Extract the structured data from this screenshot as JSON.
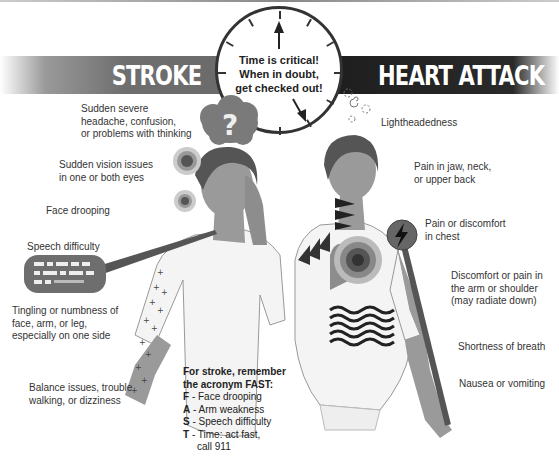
{
  "header": {
    "stroke_title": "STROKE",
    "heart_title": "HEART ATTACK"
  },
  "clock": {
    "line1": "Time is critical!",
    "line2": "When in  doubt,",
    "line3": "get checked out!"
  },
  "stroke": {
    "symptoms": [
      {
        "text_lines": [
          "Sudden severe",
          "headache, confusion,",
          "or problems with thinking"
        ]
      },
      {
        "text_lines": [
          "Sudden vision issues",
          "in one or both eyes"
        ]
      },
      {
        "text_lines": [
          "Face drooping"
        ]
      },
      {
        "text_lines": [
          "Speech difficulty"
        ]
      },
      {
        "text_lines": [
          "Tingling or numbness of",
          "face, arm, or leg,",
          "especially on one side"
        ]
      },
      {
        "text_lines": [
          "Balance issues, trouble",
          "walking, or dizziness"
        ]
      }
    ],
    "icons": {
      "thought_cloud": "question-mark",
      "speech_bubble": "garbled-text"
    },
    "fast": {
      "header_line1": "For stroke, remember",
      "header_line2": "the acronym FAST:",
      "items": [
        {
          "letter": "F",
          "text": " - Face drooping"
        },
        {
          "letter": "A",
          "text": " - Arm weakness"
        },
        {
          "letter": "S",
          "text": " - Speech difficulty"
        },
        {
          "letter": "T",
          "text": " - Time: act fast,",
          "continuation": "call 911"
        }
      ]
    }
  },
  "heart_attack": {
    "symptoms": [
      {
        "text_lines": [
          "Lightheadedness"
        ]
      },
      {
        "text_lines": [
          "Pain in jaw, neck,",
          "or upper back"
        ]
      },
      {
        "text_lines": [
          "Pain or discomfort",
          "in chest"
        ]
      },
      {
        "text_lines": [
          "Discomfort or pain in",
          "the arm or shoulder",
          "(may radiate down)"
        ]
      },
      {
        "text_lines": [
          "Shortness of breath"
        ]
      },
      {
        "text_lines": [
          "Nausea or vomiting"
        ]
      }
    ],
    "icons": {
      "chest": "target-rings",
      "arm": "lightning-bolt",
      "stomach": "wavy-lines"
    }
  },
  "colors": {
    "stroke_banner": "#6e6e6e",
    "heart_banner": "#222222",
    "figure_skin": "#9a9a9a",
    "figure_shirt": "#f4f4f4",
    "text": "#2a2a2a"
  }
}
